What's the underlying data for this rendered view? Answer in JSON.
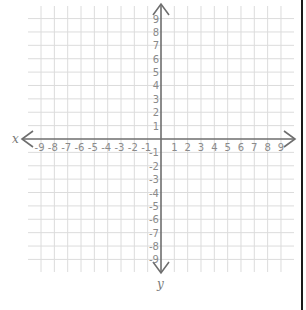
{
  "diagram": {
    "type": "coordinate-plane",
    "x_axis": {
      "label": "x",
      "min": -9,
      "max": 9,
      "step": 1
    },
    "y_axis": {
      "label": "y",
      "min": -9,
      "max": 9,
      "step": 1
    },
    "x_tick_labels": [
      "-9",
      "-8",
      "-7",
      "-6",
      "-5",
      "-4",
      "-3",
      "-2",
      "-1",
      "1",
      "2",
      "3",
      "4",
      "5",
      "6",
      "7",
      "8",
      "9"
    ],
    "y_tick_labels": [
      "9",
      "8",
      "7",
      "6",
      "5",
      "4",
      "3",
      "2",
      "1",
      "-1",
      "-2",
      "-3",
      "-4",
      "-5",
      "-6",
      "-7",
      "-8",
      "-9"
    ],
    "grid": true,
    "colors": {
      "grid": "#dcdcdc",
      "axis": "#6e6e6e",
      "tick_text": "#8a8a8a",
      "border": "#1a1a1a"
    }
  }
}
